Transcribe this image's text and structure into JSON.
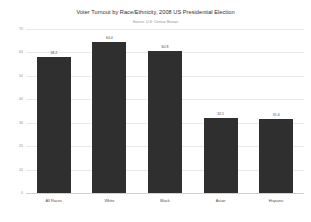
{
  "chart_data": {
    "type": "bar",
    "title": "Voter Turnout by Race/Ethnicity, 2008 US Presidential Election",
    "subtitle": "Source: U.S. Census Bureau",
    "xlabel": "",
    "ylabel": "",
    "ylim": [
      0,
      70
    ],
    "yticks": [
      0,
      10,
      20,
      30,
      40,
      50,
      60,
      70
    ],
    "ytick_labels": [
      "0",
      "10",
      "20",
      "30",
      "40",
      "50",
      "60",
      "70"
    ],
    "grid": true,
    "legend": false,
    "bar_color": "#2f2f2f",
    "categories": [
      "All Races",
      "White",
      "Black",
      "Asian",
      "Hispanic"
    ],
    "values": [
      58.2,
      64.4,
      60.8,
      32.1,
      31.6
    ],
    "value_labels": [
      "58.2",
      "64.4",
      "60.8",
      "32.1",
      "31.6"
    ]
  }
}
